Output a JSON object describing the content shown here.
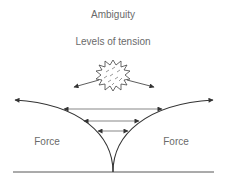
{
  "diagram": {
    "title": "Ambiguity",
    "subtitle": "Levels of tension",
    "left_label": "Force",
    "right_label": "Force",
    "colors": {
      "stroke": "#333333",
      "text": "#6a6a6a",
      "background": "#ffffff"
    },
    "elements": [
      {
        "type": "starburst",
        "meaning": "ambiguity",
        "center": [
          113,
          74
        ]
      },
      {
        "type": "arrow",
        "from": "starburst",
        "direction": "left-down"
      },
      {
        "type": "arrow",
        "from": "starburst",
        "direction": "right-down"
      },
      {
        "type": "curve",
        "side": "left",
        "from": "cusp",
        "to": "upper-left",
        "arrowhead": true
      },
      {
        "type": "curve",
        "side": "right",
        "from": "cusp",
        "to": "upper-right",
        "arrowhead": true
      },
      {
        "type": "double-arrow",
        "level": 1,
        "note": "widest tension"
      },
      {
        "type": "double-arrow",
        "level": 2
      },
      {
        "type": "double-arrow",
        "level": 3,
        "note": "narrowest tension"
      },
      {
        "type": "baseline"
      }
    ]
  }
}
